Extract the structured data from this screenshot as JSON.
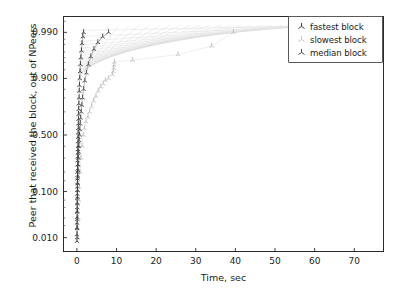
{
  "chart_data": {
    "type": "scatter",
    "title": "",
    "xlabel": "Time, sec",
    "ylabel": "Peer that received the block, out of NPeers",
    "yscale": "probit",
    "xlim": [
      -3.5,
      77.5
    ],
    "ylim": [
      0.004,
      0.9965
    ],
    "grid": false,
    "legend_position": "upper right",
    "xticks": [
      0,
      10,
      20,
      30,
      40,
      50,
      60,
      70
    ],
    "xtick_labels": [
      "0",
      "10",
      "20",
      "30",
      "40",
      "50",
      "60",
      "70"
    ],
    "yticks": [
      0.99,
      0.9,
      0.5,
      0.1,
      0.01
    ],
    "ytick_labels": [
      "0.990",
      "0.900",
      "0.500",
      "0.100",
      "0.010"
    ],
    "series": [
      {
        "name": "fastest block",
        "marker": "tri_down",
        "color": "#2b2b2b",
        "points": [
          [
            0.02,
            0.008
          ],
          [
            0.03,
            0.012
          ],
          [
            0.04,
            0.017
          ],
          [
            0.05,
            0.023
          ],
          [
            0.06,
            0.031
          ],
          [
            0.07,
            0.04
          ],
          [
            0.08,
            0.05
          ],
          [
            0.09,
            0.062
          ],
          [
            0.1,
            0.075
          ],
          [
            0.11,
            0.09
          ],
          [
            0.12,
            0.105
          ],
          [
            0.13,
            0.12
          ],
          [
            0.14,
            0.14
          ],
          [
            0.15,
            0.16
          ],
          [
            0.16,
            0.18
          ],
          [
            0.17,
            0.2
          ],
          [
            0.18,
            0.22
          ],
          [
            0.19,
            0.25
          ],
          [
            0.2,
            0.28
          ],
          [
            0.22,
            0.31
          ],
          [
            0.24,
            0.34
          ],
          [
            0.26,
            0.37
          ],
          [
            0.28,
            0.4
          ],
          [
            0.3,
            0.44
          ],
          [
            0.32,
            0.48
          ],
          [
            0.34,
            0.52
          ],
          [
            0.36,
            0.56
          ],
          [
            0.38,
            0.6
          ],
          [
            0.4,
            0.64
          ],
          [
            0.43,
            0.68
          ],
          [
            0.46,
            0.72
          ],
          [
            0.5,
            0.76
          ],
          [
            0.55,
            0.8
          ],
          [
            0.6,
            0.84
          ],
          [
            0.66,
            0.87
          ],
          [
            0.72,
            0.9
          ],
          [
            0.8,
            0.925
          ],
          [
            0.9,
            0.945
          ],
          [
            1.0,
            0.96
          ],
          [
            1.15,
            0.972
          ],
          [
            1.3,
            0.981
          ],
          [
            1.5,
            0.987
          ],
          [
            1.7,
            0.99
          ]
        ]
      },
      {
        "name": "slowest block",
        "marker": "tri_down",
        "color": "#b8b8b8",
        "points": [
          [
            0.3,
            0.01
          ],
          [
            0.4,
            0.03
          ],
          [
            0.5,
            0.07
          ],
          [
            0.6,
            0.12
          ],
          [
            0.8,
            0.2
          ],
          [
            1.0,
            0.3
          ],
          [
            1.3,
            0.4
          ],
          [
            1.6,
            0.5
          ],
          [
            1.9,
            0.56
          ],
          [
            2.3,
            0.62
          ],
          [
            2.8,
            0.66
          ],
          [
            3.2,
            0.7
          ],
          [
            3.7,
            0.74
          ],
          [
            4.2,
            0.78
          ],
          [
            4.8,
            0.81
          ],
          [
            5.4,
            0.84
          ],
          [
            6.0,
            0.862
          ],
          [
            6.6,
            0.878
          ],
          [
            7.2,
            0.892
          ],
          [
            8.0,
            0.9
          ],
          [
            9.0,
            0.915
          ],
          [
            9.2,
            0.925
          ],
          [
            9.3,
            0.935
          ],
          [
            9.4,
            0.943
          ],
          [
            9.5,
            0.951
          ],
          [
            14.0,
            0.955
          ],
          [
            25.5,
            0.966
          ],
          [
            34.0,
            0.978
          ],
          [
            39.5,
            0.99
          ]
        ]
      },
      {
        "name": "median block",
        "marker": "tri_down",
        "color": "#3a3a3a",
        "points": [
          [
            0.05,
            0.01
          ],
          [
            0.07,
            0.018
          ],
          [
            0.09,
            0.028
          ],
          [
            0.11,
            0.042
          ],
          [
            0.13,
            0.06
          ],
          [
            0.15,
            0.08
          ],
          [
            0.18,
            0.105
          ],
          [
            0.21,
            0.135
          ],
          [
            0.25,
            0.17
          ],
          [
            0.29,
            0.21
          ],
          [
            0.33,
            0.25
          ],
          [
            0.38,
            0.3
          ],
          [
            0.44,
            0.35
          ],
          [
            0.5,
            0.4
          ],
          [
            0.57,
            0.45
          ],
          [
            0.65,
            0.5
          ],
          [
            0.74,
            0.55
          ],
          [
            0.84,
            0.6
          ],
          [
            0.95,
            0.65
          ],
          [
            1.1,
            0.7
          ],
          [
            1.25,
            0.75
          ],
          [
            1.45,
            0.8
          ],
          [
            1.7,
            0.85
          ],
          [
            2.0,
            0.89
          ],
          [
            2.4,
            0.92
          ],
          [
            2.9,
            0.945
          ],
          [
            3.5,
            0.962
          ],
          [
            4.3,
            0.974
          ],
          [
            5.3,
            0.982
          ],
          [
            6.5,
            0.987
          ],
          [
            8.0,
            0.99
          ]
        ]
      }
    ],
    "fan_lines": {
      "description": "faint light-grey connecting lines radiating from origin to upper-right",
      "color": "#dcdcdc",
      "count": 24
    }
  },
  "legend": {
    "items": [
      {
        "label": "fastest block",
        "marker_color": "#2b2b2b"
      },
      {
        "label": "slowest block",
        "marker_color": "#c2c2c2"
      },
      {
        "label": "median block",
        "marker_color": "#3a3a3a"
      }
    ]
  },
  "axes": {
    "x_title": "Time, sec",
    "y_title": "Peer that received the block, out of NPeers"
  }
}
